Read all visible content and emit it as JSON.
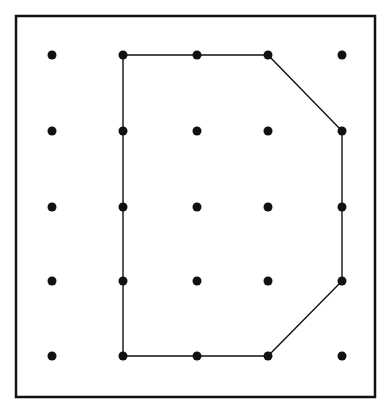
{
  "diagram": {
    "type": "dot-grid-polygon",
    "grid": {
      "rows": 5,
      "cols": 5
    },
    "dot_x": [
      52,
      123,
      197,
      268,
      342
    ],
    "dot_y": [
      55,
      131,
      207,
      281,
      356
    ],
    "polygon_vertices": [
      [
        1,
        0
      ],
      [
        3,
        0
      ],
      [
        4,
        1
      ],
      [
        4,
        2
      ],
      [
        4,
        3
      ],
      [
        3,
        4
      ],
      [
        2,
        4
      ],
      [
        1,
        4
      ],
      [
        1,
        3
      ],
      [
        1,
        2
      ],
      [
        1,
        1
      ]
    ],
    "colors": {
      "ink": "#111111",
      "background": "#ffffff"
    }
  }
}
